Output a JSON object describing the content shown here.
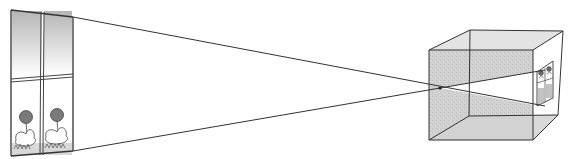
{
  "diagram": {
    "title": "Pinhole camera: inverted image of a window",
    "type": "pinhole-camera-illustration",
    "elements": {
      "object": {
        "label": "window with flowers",
        "panes": 4,
        "flowers": 2
      },
      "rays": {
        "count": 2,
        "converge_at": "pinhole"
      },
      "camera": {
        "label": "box camera (cube)",
        "pinhole": "front face center"
      },
      "image": {
        "label": "inverted image of window",
        "orientation": "upside-down"
      }
    },
    "colors": {
      "line": "#333333",
      "shade": "#bdbdbd",
      "shade_light": "#d6d6d6",
      "flower": "#7a7a7a",
      "background": "#ffffff"
    }
  }
}
